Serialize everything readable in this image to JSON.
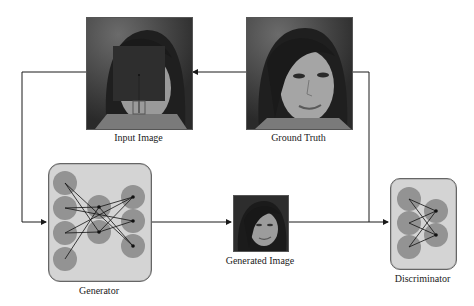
{
  "diagram": {
    "nodes": {
      "input_image": {
        "label": "Input Image",
        "description": "Face photo with square occlusion mask"
      },
      "ground_truth": {
        "label": "Ground Truth",
        "description": "Unoccluded face photo"
      },
      "generator": {
        "label": "Generator",
        "description": "Neural network block"
      },
      "generated_image": {
        "label": "Generated Image",
        "description": "Reconstructed face photo"
      },
      "discriminator": {
        "label": "Discriminator",
        "description": "Neural network block"
      }
    },
    "edges": [
      {
        "from": "ground_truth",
        "to": "input_image"
      },
      {
        "from": "input_image",
        "to": "generator"
      },
      {
        "from": "generator",
        "to": "generated_image"
      },
      {
        "from": "generated_image",
        "to": "discriminator"
      },
      {
        "from": "ground_truth",
        "to": "discriminator"
      }
    ]
  },
  "colors": {
    "line": "#1a1a1a",
    "netbox_fill": "#d4d4d4",
    "neuron_fill": "#8c8c8c",
    "mask_fill": "#2e2e2e"
  }
}
